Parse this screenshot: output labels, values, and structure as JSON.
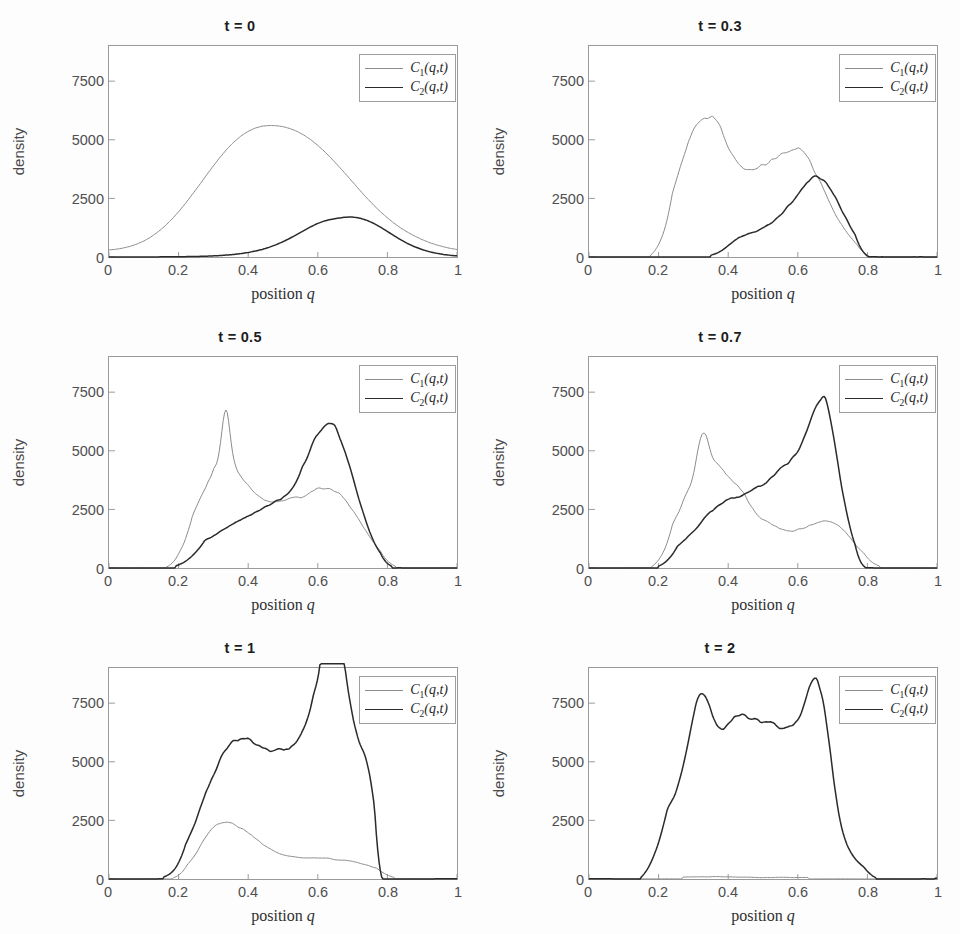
{
  "figure": {
    "xlabel_prefix": "position ",
    "xlabel_var": "q",
    "ylabel": "density",
    "xticks": [
      "0",
      "0.2",
      "0.4",
      "0.6",
      "0.8",
      "1"
    ],
    "xtick_values": [
      0,
      0.2,
      0.4,
      0.6,
      0.8,
      1
    ],
    "yticks": [
      "0",
      "2500",
      "5000",
      "7500"
    ],
    "ytick_values": [
      0,
      2500,
      5000,
      7500
    ],
    "series_colors": {
      "C1": "#8c8c8c",
      "C2": "#2b2b2b"
    },
    "series_widths": {
      "C1": 1.0,
      "C2": 1.5
    },
    "axis_color": "#9a9a9a",
    "legend": {
      "entries": [
        {
          "name": "C1",
          "label_main": "C",
          "label_sub": "1",
          "label_args": "(q,t)"
        },
        {
          "name": "C2",
          "label_main": "C",
          "label_sub": "2",
          "label_args": "(q,t)"
        }
      ]
    }
  },
  "chart_data": [
    {
      "type": "line",
      "title": "t = 0",
      "xlabel": "position q",
      "ylabel": "density",
      "xlim": [
        0,
        1
      ],
      "ylim": [
        0,
        9000
      ],
      "grid": false,
      "legend_position": "top-right",
      "x": [
        0,
        0.02,
        0.04,
        0.06,
        0.08,
        0.1,
        0.12,
        0.14,
        0.16,
        0.18,
        0.2,
        0.22,
        0.24,
        0.26,
        0.28,
        0.3,
        0.32,
        0.34,
        0.36,
        0.38,
        0.4,
        0.42,
        0.44,
        0.46,
        0.48,
        0.5,
        0.52,
        0.54,
        0.56,
        0.58,
        0.6,
        0.62,
        0.64,
        0.66,
        0.68,
        0.7,
        0.72,
        0.74,
        0.76,
        0.78,
        0.8,
        0.82,
        0.84,
        0.86,
        0.88,
        0.9,
        0.92,
        0.94,
        0.96,
        0.98,
        1
      ],
      "series": [
        {
          "name": "C1(q,t)",
          "values": [
            300,
            330,
            380,
            450,
            550,
            680,
            850,
            1060,
            1310,
            1600,
            1930,
            2290,
            2680,
            3080,
            3490,
            3890,
            4270,
            4620,
            4920,
            5170,
            5360,
            5500,
            5580,
            5610,
            5600,
            5560,
            5480,
            5360,
            5200,
            5000,
            4760,
            4490,
            4190,
            3870,
            3540,
            3200,
            2860,
            2530,
            2220,
            1930,
            1670,
            1430,
            1220,
            1040,
            880,
            740,
            620,
            520,
            440,
            370,
            320
          ]
        },
        {
          "name": "C2(q,t)",
          "values": [
            2,
            2,
            2,
            2,
            3,
            3,
            4,
            5,
            6,
            8,
            11,
            15,
            20,
            27,
            36,
            48,
            64,
            85,
            112,
            147,
            192,
            250,
            322,
            412,
            522,
            652,
            800,
            962,
            1130,
            1292,
            1434,
            1542,
            1610,
            1660,
            1700,
            1705,
            1660,
            1570,
            1440,
            1275,
            1090,
            900,
            720,
            560,
            425,
            315,
            228,
            160,
            110,
            74,
            48
          ]
        }
      ]
    },
    {
      "type": "line",
      "title": "t = 0.3",
      "xlabel": "position q",
      "ylabel": "density",
      "xlim": [
        0,
        1
      ],
      "ylim": [
        0,
        9000
      ],
      "grid": false,
      "legend_position": "top-right",
      "description": "C1 broad noisy hump peaking ~6400 near q=0.33 with secondary ~4600 plateau near q=0.65; C2 low noisy rise from q=0.35 to a ~3600 plateau near q=0.62-0.72; both drop to 0 by q=0.82",
      "c1_peak": 6400,
      "c1_peak_x": 0.33,
      "c2_peak": 3600,
      "c2_peak_x": 0.66,
      "support": [
        0.16,
        0.84
      ]
    },
    {
      "type": "line",
      "title": "t = 0.5",
      "xlabel": "position q",
      "ylabel": "density",
      "xlim": [
        0,
        1
      ],
      "ylim": [
        0,
        9000
      ],
      "grid": false,
      "legend_position": "top-right",
      "description": "C1 sharp spike ~7300 at q=0.335 above a ~4800 hump, falling to ~2700 plateau through q=0.45-0.75; C2 rises steadily from q=0.18 reaching ~5200 peak near q=0.61-0.70",
      "c1_peak": 7300,
      "c1_peak_x": 0.335,
      "c2_peak": 5200,
      "c2_peak_x": 0.62,
      "support": [
        0.15,
        0.86
      ]
    },
    {
      "type": "line",
      "title": "t = 0.7",
      "xlabel": "position q",
      "ylabel": "density",
      "xlabel_note": "",
      "ylim": [
        0,
        9000
      ],
      "xlim": [
        0,
        1
      ],
      "grid": false,
      "legend_position": "top-right",
      "description": "C1 peaks ~5300 at q=0.325 then decays to ~1500 noisy tail across q=0.55-0.80; C2 grows to ~6700 peak near q=0.68 with steep cliff after q=0.73",
      "c1_peak": 5300,
      "c1_peak_x": 0.325,
      "c2_peak": 6700,
      "c2_peak_x": 0.68,
      "support": [
        0.15,
        0.88
      ]
    },
    {
      "type": "line",
      "title": "t = 1",
      "xlabel": "position q",
      "ylabel": "density",
      "xlim": [
        0,
        1
      ],
      "ylim": [
        0,
        9000
      ],
      "grid": false,
      "legend_position": "top-right",
      "description": "C2 dominates, noisy plateau ~4200-5000 from q=0.3 to 0.58 rising to spike ~8300 at q=0.64 then cliff at q=0.76; C1 reduced to a low ~1700 bump near q=0.3 decaying to ~600 tail",
      "c1_peak": 1800,
      "c1_peak_x": 0.3,
      "c2_peak": 8300,
      "c2_peak_x": 0.64,
      "support": [
        0.12,
        0.84
      ]
    },
    {
      "type": "line",
      "title": "t = 2",
      "xlabel": "position q",
      "ylabel": "density",
      "xlim": [
        0,
        1
      ],
      "ylim": [
        0,
        9000
      ],
      "grid": false,
      "legend_position": "top-right",
      "description": "C1 depleted to ~0 everywhere; C2 forms a broad noisy plateau ~5000-5500 from q=0.28 to 0.62 with peaks ~7400 at q=0.32 and ~8700 spike at q=0.66, dropping to 0 by q=0.85",
      "c1_peak": 120,
      "c1_peak_x": 0.5,
      "c2_peak": 8700,
      "c2_peak_x": 0.66,
      "support": [
        0.13,
        0.86
      ]
    }
  ]
}
